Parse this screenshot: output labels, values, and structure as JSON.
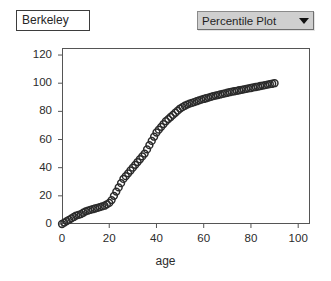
{
  "window": {
    "background": "#ffffff"
  },
  "dataset": {
    "label": "Berkeley"
  },
  "plot_type_select": {
    "name": "plot-type-dropdown",
    "selected": "Percentile Plot",
    "caret_icon": "chevron-down-icon",
    "background": "#cfcfcf"
  },
  "chart_data": {
    "type": "scatter",
    "title": "",
    "subtitle": "",
    "xlabel": "age",
    "ylabel": "",
    "xlim": [
      0,
      105
    ],
    "ylim": [
      0,
      125
    ],
    "xticks": [
      0,
      20,
      40,
      60,
      80,
      100
    ],
    "yticks": [
      0,
      20,
      40,
      60,
      80,
      100,
      120
    ],
    "xtick_labels": [
      "0",
      "20",
      "40",
      "60",
      "80",
      "100"
    ],
    "ytick_labels": [
      "0",
      "20",
      "40",
      "60",
      "80",
      "100",
      "120"
    ],
    "grid": false,
    "legend": null,
    "marker": "open-circle",
    "marker_color": "#2b2b2b",
    "marker_size": 3.4,
    "series": [
      {
        "name": "percentile",
        "x": [
          0,
          1,
          2,
          3,
          4,
          5,
          6,
          7,
          8,
          9,
          10,
          11,
          12,
          13,
          14,
          15,
          16,
          17,
          18,
          19,
          20,
          21,
          22,
          23,
          24,
          25,
          26,
          27,
          28,
          29,
          30,
          31,
          32,
          33,
          34,
          35,
          36,
          37,
          38,
          39,
          40,
          41,
          42,
          43,
          44,
          45,
          46,
          47,
          48,
          49,
          50,
          51,
          52,
          53,
          54,
          55,
          56,
          57,
          58,
          59,
          60,
          61,
          62,
          63,
          64,
          65,
          66,
          67,
          68,
          69,
          70,
          71,
          72,
          73,
          74,
          75,
          76,
          77,
          78,
          79,
          80,
          81,
          82,
          83,
          84,
          85,
          86,
          87,
          88,
          89,
          90
        ],
        "y": [
          0,
          1,
          2,
          3,
          4,
          5,
          6,
          6.5,
          7,
          8,
          9,
          9.5,
          10,
          10.5,
          11,
          11.5,
          12,
          12.5,
          13,
          14,
          15,
          17,
          20,
          23,
          26,
          29,
          32,
          34,
          36,
          38,
          40,
          42,
          44,
          46,
          48,
          50,
          53,
          56,
          59,
          62,
          65,
          67,
          69,
          71,
          73,
          74.5,
          76,
          77.5,
          79,
          80.5,
          82,
          83,
          84,
          84.8,
          85.5,
          86,
          86.6,
          87.2,
          87.8,
          88.3,
          88.8,
          89.3,
          89.8,
          90.3,
          90.8,
          91.2,
          91.6,
          92,
          92.4,
          92.8,
          93.2,
          93.6,
          94,
          94.3,
          94.6,
          95,
          95.3,
          95.6,
          96,
          96.3,
          96.6,
          97,
          97.3,
          97.6,
          98,
          98.3,
          98.6,
          99,
          99.3,
          99.6,
          100
        ]
      }
    ]
  }
}
